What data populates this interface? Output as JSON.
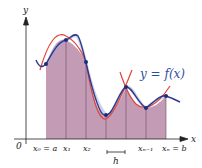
{
  "diagram": {
    "curve_label": "y = f(x)",
    "axes": {
      "x_label": "x",
      "y_label": "y",
      "origin_label": "0"
    },
    "partition_labels": [
      "x₀ = a",
      "x₁",
      "x₂",
      "xₙ₋₁",
      "xₙ = b"
    ],
    "step_label": "h",
    "colors": {
      "curve": "#2d3a8c",
      "parabola": "#e0453a",
      "region_fill": "#b88aa8",
      "region_fill_light": "#c9a5c0",
      "point": "#1f2b7a",
      "axis": "#222222",
      "label": "#2d4fa0"
    },
    "points": [
      {
        "x": 46,
        "y": 64
      },
      {
        "x": 66,
        "y": 40
      },
      {
        "x": 86,
        "y": 62
      },
      {
        "x": 106,
        "y": 115
      },
      {
        "x": 126,
        "y": 87
      },
      {
        "x": 146,
        "y": 108
      },
      {
        "x": 166,
        "y": 96
      }
    ]
  }
}
